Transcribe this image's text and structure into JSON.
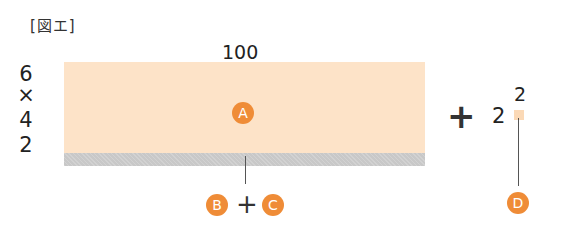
{
  "figure": {
    "label": "[図エ]",
    "width_label": "100",
    "height_factors": [
      "6",
      "×",
      "4",
      "2"
    ],
    "region_a": {
      "badge": "A",
      "color": "#fde3c8"
    },
    "strip": {
      "color": "#c8c8c8"
    },
    "bottom_formula": {
      "left_badge": "B",
      "operator": "+",
      "right_badge": "C"
    },
    "right_term": {
      "operator": "+",
      "base": "2",
      "exponent": "2",
      "badge": "D"
    },
    "accent_color": "#ef8c37"
  }
}
